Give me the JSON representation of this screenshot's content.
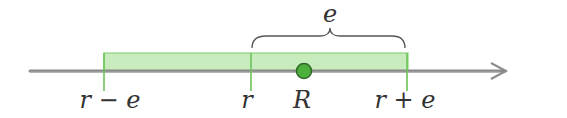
{
  "diagram": {
    "type": "number-line-interval",
    "colors": {
      "axis": "#8a8a8a",
      "band_fill": "#c8ecbd",
      "band_stroke": "#7ccf6a",
      "tick": "#6cc45a",
      "dot_fill": "#4caf3e",
      "dot_stroke": "#2f6b25",
      "text": "#333333",
      "brace": "#555555"
    },
    "labels": {
      "left_endpoint": "r − e",
      "center": "r",
      "point": "R",
      "right_endpoint": "r + e",
      "brace": "e"
    }
  }
}
